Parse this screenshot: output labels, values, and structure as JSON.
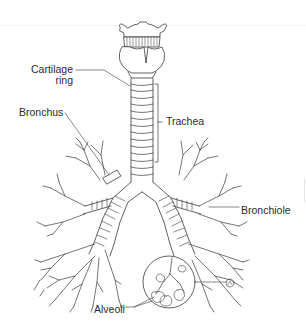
{
  "diagram": {
    "labels": {
      "cartilage_ring_line1": "Cartilage",
      "cartilage_ring_line2": "ring",
      "bronchus": "Bronchus",
      "trachea": "Trachea",
      "bronchiole": "Bronchiole",
      "alveoli": "Alveoli"
    },
    "colors": {
      "line": "#3a3a3a",
      "text": "#2a2a2a",
      "background": "#ffffff"
    }
  }
}
